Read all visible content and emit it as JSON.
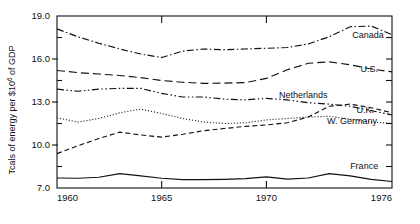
{
  "chart_data": {
    "type": "line",
    "title": "",
    "xlabel": "",
    "ylabel": "Tcals of energy per $10⁶ of GDP",
    "ylabel_parts": {
      "pre": "Tcals of energy per $10",
      "sup": "6",
      "post": " of GDP"
    },
    "xlim": [
      1960,
      1976
    ],
    "ylim": [
      7.0,
      19.0
    ],
    "grid": false,
    "legend_position": "inline-right",
    "x_ticklabels": [
      "1960",
      "1965",
      "1970",
      "1976"
    ],
    "x_tickvalues": [
      1960,
      1965,
      1970,
      1976
    ],
    "y_ticklabels": [
      "19.0",
      "16.0",
      "13.0",
      "10.0",
      "7.0"
    ],
    "y_tickvalues": [
      19.0,
      16.0,
      13.0,
      10.0,
      7.0
    ],
    "y_minor_tickvalues": [
      17.5,
      14.5,
      11.5,
      8.5
    ],
    "x": [
      1960,
      1961,
      1962,
      1963,
      1964,
      1965,
      1966,
      1967,
      1968,
      1969,
      1970,
      1971,
      1972,
      1973,
      1974,
      1975,
      1976
    ],
    "series": [
      {
        "name": "Canada",
        "linestyle": "dashdot",
        "color": "#111111",
        "label_x": 1974.1,
        "label_y": 17.45,
        "values": [
          18.1,
          17.55,
          17.1,
          16.7,
          16.35,
          16.1,
          16.55,
          16.7,
          16.65,
          16.7,
          16.75,
          16.8,
          17.05,
          17.55,
          18.25,
          18.3,
          17.7
        ]
      },
      {
        "name": "U.S.",
        "linestyle": "dashed-long",
        "color": "#111111",
        "label_x": 1974.5,
        "label_y": 15.1,
        "values": [
          15.2,
          15.05,
          14.95,
          14.85,
          14.7,
          14.5,
          14.38,
          14.3,
          14.32,
          14.35,
          14.65,
          15.25,
          15.7,
          15.8,
          15.6,
          15.3,
          15.1
        ]
      },
      {
        "name": "Netherlands",
        "linestyle": "dashed",
        "color": "#111111",
        "label_x": 1970.6,
        "label_y": 13.3,
        "values": [
          9.4,
          9.95,
          10.45,
          10.9,
          10.7,
          10.55,
          10.75,
          11.0,
          11.15,
          11.3,
          11.4,
          11.55,
          11.95,
          12.7,
          12.85,
          12.6,
          12.25
        ]
      },
      {
        "name": "U.K.",
        "linestyle": "dashdotdot",
        "color": "#111111",
        "label_x": 1974.3,
        "label_y": 12.25,
        "values": [
          13.9,
          13.75,
          13.9,
          13.95,
          13.95,
          13.6,
          13.35,
          13.35,
          13.2,
          13.15,
          13.25,
          13.15,
          12.95,
          12.85,
          12.7,
          12.4,
          12.1
        ]
      },
      {
        "name": "W. Germany",
        "linestyle": "dotted",
        "color": "#111111",
        "label_x": 1972.9,
        "label_y": 11.45,
        "values": [
          11.9,
          11.6,
          11.85,
          12.25,
          12.5,
          12.2,
          11.85,
          11.6,
          11.5,
          11.55,
          11.75,
          11.85,
          11.95,
          12.0,
          11.8,
          11.6,
          11.5
        ]
      },
      {
        "name": "France",
        "linestyle": "solid",
        "color": "#111111",
        "label_x": 1974.0,
        "label_y": 8.35,
        "values": [
          7.7,
          7.68,
          7.75,
          8.0,
          7.85,
          7.68,
          7.58,
          7.58,
          7.6,
          7.65,
          7.78,
          7.62,
          7.7,
          8.0,
          7.85,
          7.6,
          7.45
        ]
      }
    ]
  }
}
